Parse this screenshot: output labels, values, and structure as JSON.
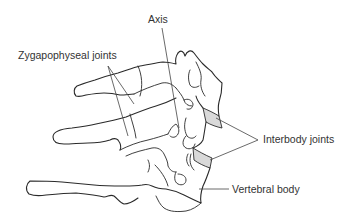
{
  "figure": {
    "colors": {
      "line": "#2a2a2a",
      "disc_fill": "#d9d9d9",
      "label_text": "#333333",
      "background": "#ffffff"
    }
  },
  "labels": {
    "axis": "Axis",
    "zygapophyseal_joints": "Zygapophyseal joints",
    "interbody_joints": "Interbody joints",
    "vertebral_body": "Vertebral body"
  }
}
